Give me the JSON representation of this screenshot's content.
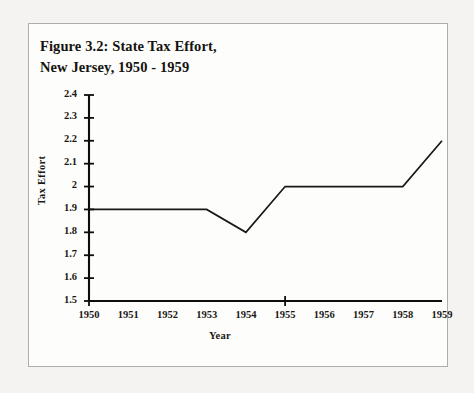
{
  "figure": {
    "title_line1": "Figure 3.2: State Tax Effort,",
    "title_line2": "New Jersey, 1950 - 1959",
    "border_color": "#b0aeaa",
    "page_background": "#f4f3f1",
    "panel_background": "#fdfdfc"
  },
  "chart_data": {
    "type": "line",
    "title": "Figure 3.2: State Tax Effort, New Jersey, 1950 - 1959",
    "xlabel": "Year",
    "ylabel": "Tax Effort",
    "x": [
      1950,
      1951,
      1952,
      1953,
      1954,
      1955,
      1956,
      1957,
      1958,
      1959
    ],
    "values": [
      1.9,
      1.9,
      1.9,
      1.9,
      1.8,
      2.0,
      2.0,
      2.0,
      2.0,
      2.2
    ],
    "series": [
      {
        "name": "Tax Effort",
        "values": [
          1.9,
          1.9,
          1.9,
          1.9,
          1.8,
          2.0,
          2.0,
          2.0,
          2.0,
          2.2
        ],
        "color": "#1a1814"
      }
    ],
    "xlim": [
      1950,
      1959
    ],
    "ylim": [
      1.5,
      2.4
    ],
    "x_tick_labels": [
      "1950",
      "1951",
      "1952",
      "1953",
      "1954",
      "1955",
      "1956",
      "1957",
      "1958",
      "1959"
    ],
    "y_tick_labels": [
      "1.5",
      "1.6",
      "1.7",
      "1.8",
      "1.9",
      "2",
      "2.1",
      "2.2",
      "2.3",
      "2.4"
    ],
    "y_tick_values": [
      1.5,
      1.6,
      1.7,
      1.8,
      1.9,
      2.0,
      2.1,
      2.2,
      2.3,
      2.4
    ],
    "x_major_ticks": [
      1950,
      1955
    ],
    "grid": false,
    "legend": false,
    "markers": false,
    "line_color": "#1a1814",
    "axis_color": "#100e0b"
  }
}
